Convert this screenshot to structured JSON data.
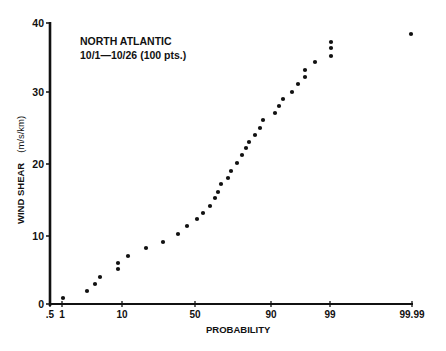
{
  "chart_data": {
    "type": "scatter",
    "title": "",
    "annotation": [
      "NORTH ATLANTIC",
      "10/1—10/26 (100 pts.)"
    ],
    "xlabel": "PROBABILITY",
    "ylabel": "WIND SHEAR",
    "ylabel_units": "(m/s/km)",
    "x_scale": "normal probability",
    "x_ticks": [
      {
        "label": ".5",
        "value": 0.5
      },
      {
        "label": "1",
        "value": 1
      },
      {
        "label": "10",
        "value": 10
      },
      {
        "label": "50",
        "value": 50
      },
      {
        "label": "90",
        "value": 90
      },
      {
        "label": "99",
        "value": 99
      },
      {
        "label": "99.99",
        "value": 99.99
      }
    ],
    "y_ticks": [
      0,
      10,
      20,
      30,
      40
    ],
    "ylim": [
      0,
      40
    ],
    "grid": false,
    "legend": null,
    "series": [
      {
        "name": "North Atlantic 10/1-10/26",
        "points": [
          {
            "x": 1.0,
            "y": 0.9
          },
          {
            "x": 3.5,
            "y": 1.8
          },
          {
            "x": 5.0,
            "y": 2.8
          },
          {
            "x": 6.0,
            "y": 3.8
          },
          {
            "x": 9.5,
            "y": 5.0
          },
          {
            "x": 9.5,
            "y": 5.8
          },
          {
            "x": 12,
            "y": 6.8
          },
          {
            "x": 18,
            "y": 8.0
          },
          {
            "x": 26,
            "y": 8.8
          },
          {
            "x": 38,
            "y": 10.0
          },
          {
            "x": 45,
            "y": 11.1
          },
          {
            "x": 53,
            "y": 12.1
          },
          {
            "x": 57,
            "y": 12.9
          },
          {
            "x": 61,
            "y": 13.9
          },
          {
            "x": 64,
            "y": 15.1
          },
          {
            "x": 65,
            "y": 16.0
          },
          {
            "x": 67,
            "y": 17.1
          },
          {
            "x": 71,
            "y": 18.0
          },
          {
            "x": 72,
            "y": 19.0
          },
          {
            "x": 75,
            "y": 20.1
          },
          {
            "x": 77,
            "y": 21.3
          },
          {
            "x": 79,
            "y": 22.2
          },
          {
            "x": 80,
            "y": 23.0
          },
          {
            "x": 82,
            "y": 24.0
          },
          {
            "x": 85,
            "y": 25.1
          },
          {
            "x": 86,
            "y": 26.1
          },
          {
            "x": 90,
            "y": 27.2
          },
          {
            "x": 91,
            "y": 28.2
          },
          {
            "x": 92,
            "y": 29.2
          },
          {
            "x": 94,
            "y": 30.4
          },
          {
            "x": 95,
            "y": 31.3
          },
          {
            "x": 96,
            "y": 32.3
          },
          {
            "x": 96,
            "y": 33.3
          },
          {
            "x": 97.5,
            "y": 34.4
          },
          {
            "x": 99,
            "y": 35.3
          },
          {
            "x": 99,
            "y": 36.4
          },
          {
            "x": 99,
            "y": 37.2
          },
          {
            "x": 99.99,
            "y": 38.4
          }
        ]
      }
    ]
  },
  "layout": {
    "plot": {
      "x0": 50,
      "y0": 304,
      "x1": 413,
      "y1": 23
    },
    "x_tick_px": [
      50,
      62,
      122,
      195,
      271,
      330,
      412
    ],
    "y_tick_px": [
      304,
      236,
      164,
      92,
      23
    ],
    "point_px": [
      [
        63,
        298
      ],
      [
        87,
        291
      ],
      [
        95,
        284
      ],
      [
        100,
        277
      ],
      [
        118,
        269
      ],
      [
        118,
        263
      ],
      [
        128,
        256
      ],
      [
        146,
        248
      ],
      [
        163,
        242
      ],
      [
        178,
        234
      ],
      [
        187,
        226
      ],
      [
        197,
        219
      ],
      [
        203,
        213
      ],
      [
        210,
        206
      ],
      [
        215,
        198
      ],
      [
        218,
        192
      ],
      [
        221,
        184
      ],
      [
        228,
        178
      ],
      [
        231,
        171
      ],
      [
        237,
        163
      ],
      [
        242,
        155
      ],
      [
        246,
        148
      ],
      [
        249,
        142
      ],
      [
        255,
        135
      ],
      [
        260,
        128
      ],
      [
        263,
        120
      ],
      [
        275,
        113
      ],
      [
        279,
        106
      ],
      [
        283,
        99
      ],
      [
        292,
        92
      ],
      [
        298,
        84
      ],
      [
        305,
        77
      ],
      [
        305,
        70
      ],
      [
        315,
        62
      ],
      [
        331,
        56
      ],
      [
        331,
        48
      ],
      [
        331,
        42
      ],
      [
        411,
        34
      ]
    ]
  }
}
